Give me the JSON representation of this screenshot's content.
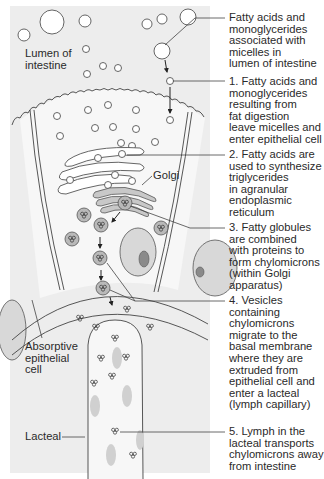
{
  "diagram": {
    "type": "biological process diagram",
    "colors": {
      "background_panel": "#ededed",
      "cell_fill": "#f7f7f7",
      "globule_fill": "#b9b9b9",
      "nucleus_fill": "#8a8a8a",
      "outline": "#444444",
      "text": "#2a2a2a"
    },
    "labels": {
      "lumen": "Lumen of\nintestine",
      "golgi": "Golgi",
      "absorptive_cell": "Absorptive\nepithelial\ncell",
      "lacteal": "Lacteal"
    },
    "annotations": [
      {
        "id": "micelles",
        "text": "Fatty acids and\nmonoglycerides\nassociated with\nmicelles in\nlumen of intestine"
      },
      {
        "id": "step1",
        "text": "1. Fatty acids and\nmonoglycerides\nresulting from\nfat digestion\nleave micelles and\nenter epithelial cell"
      },
      {
        "id": "step2",
        "text": "2. Fatty acids are\nused to synthesize\ntriglycerides\nin agranular\nendoplasmic\nreticulum"
      },
      {
        "id": "step3",
        "text": "3. Fatty globules\nare combined\nwith proteins to\nform chylomicrons\n(within Golgi\napparatus)"
      },
      {
        "id": "step4",
        "text": "4. Vesicles\ncontaining\nchylomicrons\nmigrate to the\nbasal membrane\nwhere they are\nextruded from\nepithelial cell and\nenter a lacteal\n(lymph capillary)"
      },
      {
        "id": "step5",
        "text": "5. Lymph in the\nlacteal transports\nchylomicrons away\nfrom intestine"
      }
    ]
  }
}
